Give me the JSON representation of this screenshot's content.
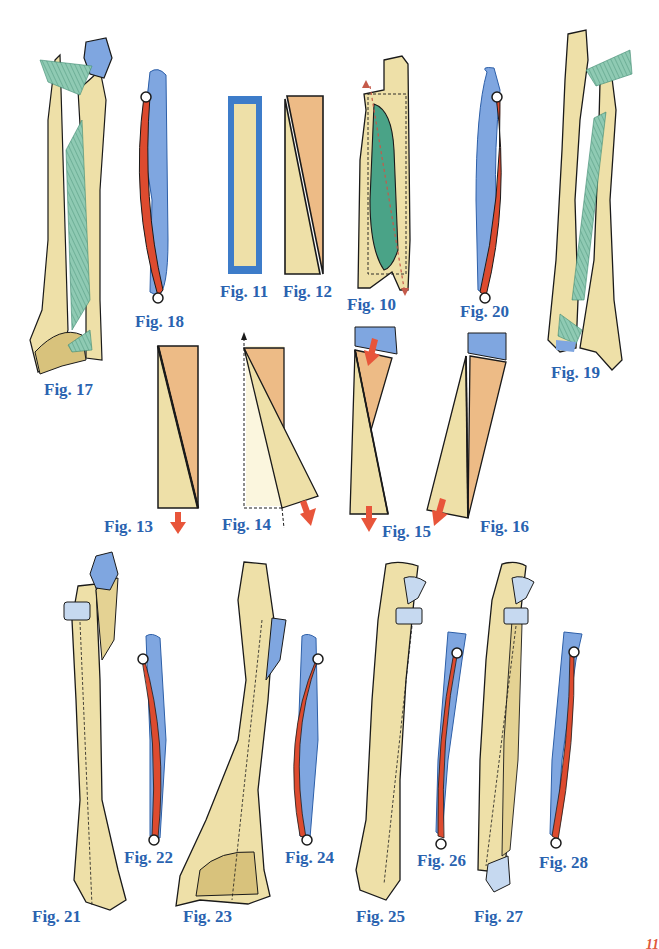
{
  "colors": {
    "bone": "#eee0a8",
    "bone_shade": "#d8c27c",
    "orange_block": "#edbb86",
    "blue": "#7fa6e0",
    "blue_light": "#c6d9f0",
    "blue_border": "#3d7cc9",
    "red_muscle": "#dd4b2f",
    "green_ligament": "#6fb59a",
    "arrow": "#e8553a",
    "label": "#2a63b0",
    "outline": "#1a1a1a"
  },
  "figures": [
    {
      "id": "fig-10",
      "label": "Fig. 10"
    },
    {
      "id": "fig-11",
      "label": "Fig. 11"
    },
    {
      "id": "fig-12",
      "label": "Fig. 12"
    },
    {
      "id": "fig-13",
      "label": "Fig. 13"
    },
    {
      "id": "fig-14",
      "label": "Fig. 14"
    },
    {
      "id": "fig-15",
      "label": "Fig. 15"
    },
    {
      "id": "fig-16",
      "label": "Fig. 16"
    },
    {
      "id": "fig-17",
      "label": "Fig. 17"
    },
    {
      "id": "fig-18",
      "label": "Fig. 18"
    },
    {
      "id": "fig-19",
      "label": "Fig. 19"
    },
    {
      "id": "fig-20",
      "label": "Fig. 20"
    },
    {
      "id": "fig-21",
      "label": "Fig. 21"
    },
    {
      "id": "fig-22",
      "label": "Fig. 22"
    },
    {
      "id": "fig-23",
      "label": "Fig. 23"
    },
    {
      "id": "fig-24",
      "label": "Fig. 24"
    },
    {
      "id": "fig-25",
      "label": "Fig. 25"
    },
    {
      "id": "fig-26",
      "label": "Fig. 26"
    },
    {
      "id": "fig-27",
      "label": "Fig. 27"
    },
    {
      "id": "fig-28",
      "label": "Fig. 28"
    }
  ],
  "page_number": "11"
}
